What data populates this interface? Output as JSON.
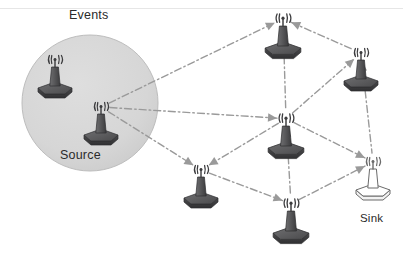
{
  "diagram": {
    "title_labels": {
      "events": "Events",
      "source": "Source",
      "sink": "Sink"
    },
    "canvas": {
      "width": 403,
      "height": 272,
      "background": "#ffffff"
    },
    "colors": {
      "node_dark": "#5a5a5c",
      "node_dark_shadow": "#3d3d3f",
      "node_light_fill": "#ffffff",
      "node_outline": "#6b6b6b",
      "link": "#9a9a9a",
      "arrow": "#9a9a9a",
      "region_fill": "#d6d6d6",
      "region_stroke": "#bdbdbd",
      "text": "#2b2b2b",
      "top_rule": "#e2e2e2"
    },
    "event_region": {
      "shape": "circle",
      "cx": 90,
      "cy": 103,
      "r": 68,
      "label": "Events",
      "label_x": 69,
      "label_y": 8
    },
    "top_rule": {
      "x1": 0,
      "y1": 8,
      "x2": 403,
      "y2": 8
    },
    "nodes": [
      {
        "id": "n-event-1",
        "name": "sensor-node-event-upper",
        "x": 55,
        "y": 86,
        "scale": 1.0,
        "style": "dark",
        "label": ""
      },
      {
        "id": "n-source",
        "name": "sensor-node-source",
        "x": 101,
        "y": 133,
        "scale": 1.0,
        "style": "dark",
        "label": "Source"
      },
      {
        "id": "n-top",
        "name": "sensor-node-top",
        "x": 283,
        "y": 46,
        "scale": 1.05,
        "style": "dark",
        "label": ""
      },
      {
        "id": "n-upper-right",
        "name": "sensor-node-upper-right",
        "x": 361,
        "y": 79,
        "scale": 1.0,
        "style": "dark",
        "label": ""
      },
      {
        "id": "n-center",
        "name": "sensor-node-center",
        "x": 286,
        "y": 146,
        "scale": 1.05,
        "style": "dark",
        "label": ""
      },
      {
        "id": "n-bottom-left",
        "name": "sensor-node-bottom-left",
        "x": 201,
        "y": 196,
        "scale": 1.0,
        "style": "dark",
        "label": ""
      },
      {
        "id": "n-bottom",
        "name": "sensor-node-bottom",
        "x": 291,
        "y": 231,
        "scale": 1.05,
        "style": "dark",
        "label": ""
      },
      {
        "id": "n-sink",
        "name": "sink-node",
        "x": 373,
        "y": 188,
        "scale": 1.0,
        "style": "light",
        "label": "Sink"
      }
    ],
    "links": [
      {
        "from": "n-source",
        "to": "n-top",
        "style": "dash-dot",
        "arrow": "to"
      },
      {
        "from": "n-source",
        "to": "n-center",
        "style": "dash-dot",
        "arrow": "to"
      },
      {
        "from": "n-source",
        "to": "n-bottom-left",
        "style": "dash-dot",
        "arrow": "to"
      },
      {
        "from": "n-top",
        "to": "n-upper-right",
        "style": "dash-dot",
        "arrow": "from"
      },
      {
        "from": "n-top",
        "to": "n-center",
        "style": "dash-dot",
        "arrow": "from"
      },
      {
        "from": "n-center",
        "to": "n-upper-right",
        "style": "dash-dot",
        "arrow": "to"
      },
      {
        "from": "n-center",
        "to": "n-bottom-left",
        "style": "dash-dot",
        "arrow": "to"
      },
      {
        "from": "n-center",
        "to": "n-bottom",
        "style": "dash-dot",
        "arrow": "from"
      },
      {
        "from": "n-bottom-left",
        "to": "n-bottom",
        "style": "dash-dot",
        "arrow": "to"
      },
      {
        "from": "n-bottom",
        "to": "n-sink",
        "style": "dash-dot",
        "arrow": "to"
      },
      {
        "from": "n-upper-right",
        "to": "n-sink",
        "style": "dash-dot",
        "arrow": "from"
      },
      {
        "from": "n-center",
        "to": "n-sink",
        "style": "dash-dot",
        "arrow": "to"
      }
    ]
  }
}
